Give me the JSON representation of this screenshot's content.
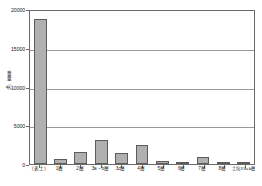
{
  "chart_data": {
    "type": "bar",
    "title": "",
    "xlabel": "",
    "ylabel": "重量（g）",
    "ylim": [
      0,
      20000
    ],
    "yticks": [
      0,
      5000,
      10000,
      15000,
      20000
    ],
    "ytick_labels": [
      "0",
      "5000",
      "10000",
      "15000",
      "20000"
    ],
    "grid": true,
    "legend": false,
    "categories": [
      "（表土）",
      "1層",
      "2層",
      "3a・b層",
      "3c層",
      "4層",
      "5層",
      "6層",
      "7層",
      "8層",
      "土坑3 9a-b層"
    ],
    "values": [
      18700,
      700,
      1500,
      3100,
      1450,
      2400,
      450,
      60,
      950,
      40,
      120
    ],
    "series": [
      {
        "name": "重量",
        "values": [
          18700,
          700,
          1500,
          3100,
          1450,
          2400,
          450,
          60,
          950,
          40,
          120
        ]
      }
    ],
    "colors": {
      "bar_fill": "#b0b0b0",
      "bar_edge": "#5c5c5c",
      "frame": "#6a6a6a",
      "grid": "#9a9a9a",
      "text": "#1a1a1a",
      "background": "#ffffff"
    }
  }
}
